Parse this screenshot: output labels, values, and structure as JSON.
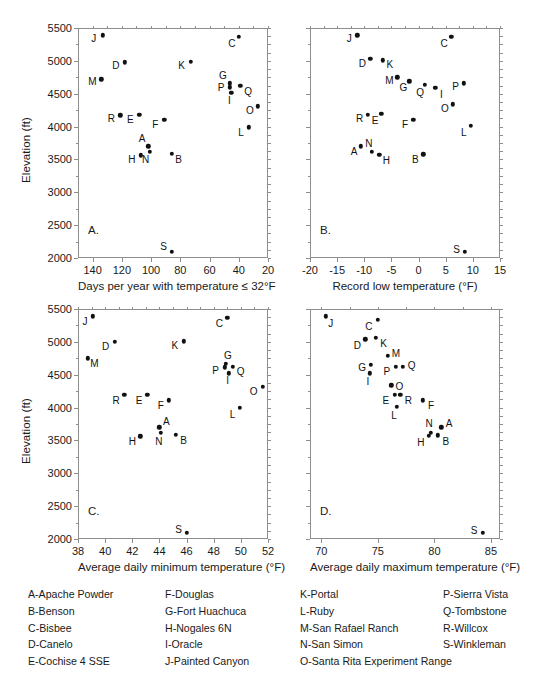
{
  "figure": {
    "y_axis_label": "Elevation (ft)",
    "y_ticks": [
      2000,
      2500,
      3000,
      3500,
      4000,
      4500,
      5000,
      5500
    ],
    "y_range": [
      2000,
      5500
    ]
  },
  "chart_data": [
    {
      "type": "scatter",
      "panel": "A.",
      "title": "",
      "xlabel": "Days per year with temperature ≤ 32°F",
      "ylabel": "Elevation (ft)",
      "xlim": [
        150,
        20
      ],
      "ylim": [
        2000,
        5500
      ],
      "x_reversed": true,
      "xticks": [
        140,
        120,
        100,
        80,
        60,
        40,
        20
      ],
      "yticks": [
        2000,
        2500,
        3000,
        3500,
        4000,
        4500,
        5000,
        5500
      ],
      "grid": false,
      "legend": "none",
      "points": [
        {
          "label": "J",
          "x": 133,
          "y": 5390,
          "lx": -9,
          "ly": 4
        },
        {
          "label": "M",
          "x": 134,
          "y": 4720,
          "lx": -9,
          "ly": 3
        },
        {
          "label": "D",
          "x": 118,
          "y": 4980,
          "lx": -9,
          "ly": 4
        },
        {
          "label": "R",
          "x": 121,
          "y": 4170,
          "lx": -9,
          "ly": 4
        },
        {
          "label": "E",
          "x": 108,
          "y": 4180,
          "lx": -9,
          "ly": 5
        },
        {
          "label": "H",
          "x": 107,
          "y": 3560,
          "lx": -9,
          "ly": 5
        },
        {
          "label": "N",
          "x": 101,
          "y": 3620,
          "lx": -4,
          "ly": 8
        },
        {
          "label": "A",
          "x": 102,
          "y": 3700,
          "lx": -6,
          "ly": -7
        },
        {
          "label": "F",
          "x": 91,
          "y": 4100,
          "lx": -9,
          "ly": 5
        },
        {
          "label": "B",
          "x": 86,
          "y": 3590,
          "lx": 7,
          "ly": 6
        },
        {
          "label": "S",
          "x": 86,
          "y": 2090,
          "lx": -8,
          "ly": -5
        },
        {
          "label": "K",
          "x": 73,
          "y": 4990,
          "lx": -9,
          "ly": 4
        },
        {
          "label": "C",
          "x": 40,
          "y": 5370,
          "lx": -7,
          "ly": 7
        },
        {
          "label": "G",
          "x": 46,
          "y": 4660,
          "lx": -7,
          "ly": -7
        },
        {
          "label": "P",
          "x": 46,
          "y": 4600,
          "lx": -9,
          "ly": 1
        },
        {
          "label": "I",
          "x": 45,
          "y": 4510,
          "lx": -2,
          "ly": 8
        },
        {
          "label": "Q",
          "x": 39,
          "y": 4620,
          "lx": 8,
          "ly": 6
        },
        {
          "label": "O",
          "x": 27,
          "y": 4310,
          "lx": -8,
          "ly": 5
        },
        {
          "label": "L",
          "x": 33,
          "y": 3990,
          "lx": -8,
          "ly": 6
        }
      ]
    },
    {
      "type": "scatter",
      "panel": "B.",
      "title": "",
      "xlabel": "Record low temperature (°F)",
      "ylabel": "Elevation (ft)",
      "xlim": [
        -20,
        15
      ],
      "ylim": [
        2000,
        5500
      ],
      "x_reversed": false,
      "xticks": [
        -20,
        -15,
        -10,
        -5,
        0,
        5,
        10,
        15
      ],
      "yticks": [
        2000,
        2500,
        3000,
        3500,
        4000,
        4500,
        5000,
        5500
      ],
      "grid": false,
      "legend": "none",
      "points": [
        {
          "label": "J",
          "x": -11.3,
          "y": 5390,
          "lx": -8,
          "ly": 4
        },
        {
          "label": "C",
          "x": 6.0,
          "y": 5370,
          "lx": -7,
          "ly": 7
        },
        {
          "label": "D",
          "x": -8.9,
          "y": 5030,
          "lx": -8,
          "ly": 5
        },
        {
          "label": "K",
          "x": -6.6,
          "y": 5010,
          "lx": 7,
          "ly": 5
        },
        {
          "label": "M",
          "x": -3.9,
          "y": 4750,
          "lx": -8,
          "ly": 4
        },
        {
          "label": "G",
          "x": -1.7,
          "y": 4690,
          "lx": -6,
          "ly": 7
        },
        {
          "label": "Q",
          "x": 1.2,
          "y": 4640,
          "lx": -5,
          "ly": 8
        },
        {
          "label": "I",
          "x": 3.1,
          "y": 4590,
          "lx": 6,
          "ly": 7
        },
        {
          "label": "P",
          "x": 8.3,
          "y": 4660,
          "lx": -8,
          "ly": 4
        },
        {
          "label": "O",
          "x": 6.3,
          "y": 4340,
          "lx": -8,
          "ly": 5
        },
        {
          "label": "R",
          "x": -9.4,
          "y": 4180,
          "lx": -8,
          "ly": 4
        },
        {
          "label": "E",
          "x": -6.9,
          "y": 4190,
          "lx": -6,
          "ly": 7
        },
        {
          "label": "F",
          "x": -1.0,
          "y": 4100,
          "lx": -8,
          "ly": 5
        },
        {
          "label": "L",
          "x": 9.6,
          "y": 4010,
          "lx": -7,
          "ly": 7
        },
        {
          "label": "A",
          "x": -10.6,
          "y": 3700,
          "lx": -7,
          "ly": 6
        },
        {
          "label": "N",
          "x": -8.6,
          "y": 3620,
          "lx": -3,
          "ly": -8
        },
        {
          "label": "H",
          "x": -7.2,
          "y": 3570,
          "lx": 7,
          "ly": 6
        },
        {
          "label": "B",
          "x": 0.9,
          "y": 3580,
          "lx": -8,
          "ly": 6
        },
        {
          "label": "S",
          "x": 8.5,
          "y": 2090,
          "lx": -8,
          "ly": -2
        }
      ]
    },
    {
      "type": "scatter",
      "panel": "C.",
      "title": "",
      "xlabel": "Average daily minimum temperature (°F)",
      "ylabel": "Elevation (ft)",
      "xlim": [
        38,
        52
      ],
      "ylim": [
        2000,
        5500
      ],
      "x_reversed": false,
      "xticks": [
        38,
        40,
        42,
        44,
        46,
        48,
        50,
        52
      ],
      "yticks": [
        2000,
        2500,
        3000,
        3500,
        4000,
        4500,
        5000,
        5500
      ],
      "grid": false,
      "legend": "none",
      "points": [
        {
          "label": "J",
          "x": 39.1,
          "y": 5390,
          "lx": -8,
          "ly": 6
        },
        {
          "label": "C",
          "x": 49.0,
          "y": 5370,
          "lx": -8,
          "ly": 6
        },
        {
          "label": "D",
          "x": 40.7,
          "y": 5000,
          "lx": -9,
          "ly": 5
        },
        {
          "label": "K",
          "x": 45.8,
          "y": 5010,
          "lx": -9,
          "ly": 5
        },
        {
          "label": "M",
          "x": 38.7,
          "y": 4750,
          "lx": 7,
          "ly": 6
        },
        {
          "label": "G",
          "x": 48.9,
          "y": 4670,
          "lx": 2,
          "ly": -8
        },
        {
          "label": "P",
          "x": 48.8,
          "y": 4610,
          "lx": -9,
          "ly": 4
        },
        {
          "label": "Q",
          "x": 49.4,
          "y": 4620,
          "lx": 8,
          "ly": 5
        },
        {
          "label": "I",
          "x": 49.1,
          "y": 4520,
          "lx": -1,
          "ly": 8
        },
        {
          "label": "O",
          "x": 51.6,
          "y": 4320,
          "lx": -9,
          "ly": 5
        },
        {
          "label": "R",
          "x": 41.4,
          "y": 4190,
          "lx": -8,
          "ly": 6
        },
        {
          "label": "E",
          "x": 43.1,
          "y": 4190,
          "lx": -8,
          "ly": 6
        },
        {
          "label": "F",
          "x": 44.7,
          "y": 4110,
          "lx": -8,
          "ly": 6
        },
        {
          "label": "L",
          "x": 49.9,
          "y": 4000,
          "lx": -7,
          "ly": 7
        },
        {
          "label": "A",
          "x": 44.0,
          "y": 3700,
          "lx": 7,
          "ly": -5
        },
        {
          "label": "N",
          "x": 44.1,
          "y": 3620,
          "lx": -2,
          "ly": 9
        },
        {
          "label": "H",
          "x": 42.6,
          "y": 3560,
          "lx": -8,
          "ly": 6
        },
        {
          "label": "B",
          "x": 45.2,
          "y": 3590,
          "lx": 8,
          "ly": 6
        },
        {
          "label": "S",
          "x": 46.0,
          "y": 2090,
          "lx": -8,
          "ly": -3
        }
      ]
    },
    {
      "type": "scatter",
      "panel": "D.",
      "title": "",
      "xlabel": "Average daily maximum temperature (°F)",
      "ylabel": "Elevation (ft)",
      "xlim": [
        69,
        85.8
      ],
      "ylim": [
        2000,
        5500
      ],
      "x_reversed": false,
      "xticks": [
        70,
        75,
        80,
        85
      ],
      "yticks": [
        2000,
        2500,
        3000,
        3500,
        4000,
        4500,
        5000,
        5500
      ],
      "grid": false,
      "legend": "none",
      "points": [
        {
          "label": "J",
          "x": 70.4,
          "y": 5390,
          "lx": 5,
          "ly": 8
        },
        {
          "label": "C",
          "x": 75.0,
          "y": 5340,
          "lx": -9,
          "ly": 7
        },
        {
          "label": "D",
          "x": 73.9,
          "y": 5040,
          "lx": -8,
          "ly": 7
        },
        {
          "label": "K",
          "x": 74.8,
          "y": 5060,
          "lx": 8,
          "ly": 6
        },
        {
          "label": "M",
          "x": 75.9,
          "y": 4790,
          "lx": 8,
          "ly": -2
        },
        {
          "label": "G",
          "x": 74.4,
          "y": 4650,
          "lx": -9,
          "ly": 3
        },
        {
          "label": "P",
          "x": 76.6,
          "y": 4620,
          "lx": -9,
          "ly": 5
        },
        {
          "label": "Q",
          "x": 77.2,
          "y": 4620,
          "lx": 9,
          "ly": -1
        },
        {
          "label": "I",
          "x": 74.3,
          "y": 4520,
          "lx": -2,
          "ly": 9
        },
        {
          "label": "O",
          "x": 76.2,
          "y": 4340,
          "lx": 8,
          "ly": 2
        },
        {
          "label": "E",
          "x": 76.5,
          "y": 4190,
          "lx": -9,
          "ly": 6
        },
        {
          "label": "R",
          "x": 77.0,
          "y": 4190,
          "lx": 8,
          "ly": 6
        },
        {
          "label": "F",
          "x": 79.0,
          "y": 4110,
          "lx": 8,
          "ly": 6
        },
        {
          "label": "L",
          "x": 76.7,
          "y": 4010,
          "lx": -3,
          "ly": 9
        },
        {
          "label": "N",
          "x": 79.7,
          "y": 3620,
          "lx": -2,
          "ly": -9
        },
        {
          "label": "A",
          "x": 80.6,
          "y": 3700,
          "lx": 8,
          "ly": -3
        },
        {
          "label": "H",
          "x": 79.5,
          "y": 3570,
          "lx": -8,
          "ly": 7
        },
        {
          "label": "B",
          "x": 80.3,
          "y": 3580,
          "lx": 8,
          "ly": 7
        },
        {
          "label": "S",
          "x": 84.3,
          "y": 2090,
          "lx": -9,
          "ly": -2
        }
      ]
    }
  ],
  "legend": {
    "columns": [
      {
        "items": [
          "A-Apache Powder",
          "B-Benson",
          "C-Bisbee",
          "D-Canelo",
          "E-Cochise 4 SSE"
        ]
      },
      {
        "items": [
          "F-Douglas",
          "G-Fort Huachuca",
          "H-Nogales 6N",
          "I-Oracle",
          "J-Painted Canyon"
        ]
      },
      {
        "items": [
          "K-Portal",
          "L-Ruby",
          "M-San Rafael Ranch",
          "N-San Simon",
          "O-Santa Rita Experiment Range"
        ]
      },
      {
        "items": [
          "P-Sierra Vista",
          "Q-Tombstone",
          "R-Willcox",
          "S-Winkleman"
        ]
      }
    ]
  }
}
